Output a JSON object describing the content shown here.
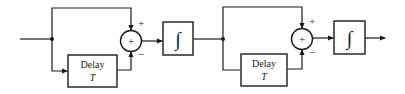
{
  "diagram": {
    "stage1": {
      "delay": {
        "label": "Delay",
        "param": "T"
      },
      "summer": {
        "symbol": "+",
        "top_sign": "+",
        "bottom_sign": "−"
      },
      "integrator": {
        "symbol": "∫"
      }
    },
    "stage2": {
      "delay": {
        "label": "Delay",
        "param": "T"
      },
      "summer": {
        "symbol": "+",
        "top_sign": "+",
        "bottom_sign": "−"
      },
      "integrator": {
        "symbol": "∫"
      }
    },
    "colors": {
      "line": "#1a1a1a",
      "background": "#ffffff"
    }
  }
}
